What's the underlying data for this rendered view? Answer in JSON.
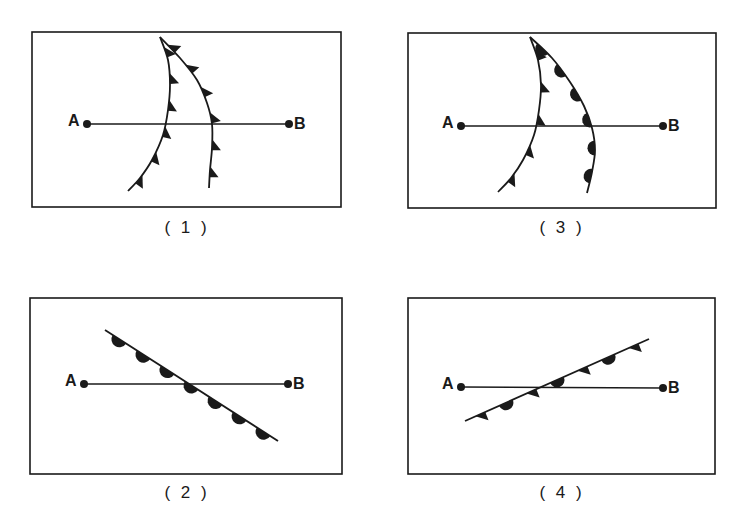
{
  "colors": {
    "ink": "#1a1a1a",
    "background": "#ffffff"
  },
  "panels": [
    {
      "id": "1",
      "caption": "( 1 )",
      "caption_pos": [
        187,
        229
      ],
      "box": [
        32,
        32,
        341,
        207
      ],
      "point_a": {
        "label": "A",
        "x": 87,
        "y": 124
      },
      "point_b": {
        "label": "B",
        "x": 289,
        "y": 124
      },
      "fronts": [
        {
          "type": "cold",
          "description": "Cold front (triangles) curving from top to lower-left",
          "path": [
            [
              160,
              37
            ],
            [
              168,
              60
            ],
            [
              170,
              85
            ],
            [
              168,
              110
            ],
            [
              163,
              135
            ],
            [
              152,
              160
            ],
            [
              140,
              178
            ],
            [
              128,
              191
            ]
          ],
          "symbol_count": 6,
          "side": "right"
        },
        {
          "type": "cold",
          "description": "Cold front (triangles) curving from top to bottom",
          "path": [
            [
              160,
              37
            ],
            [
              180,
              58
            ],
            [
              197,
              80
            ],
            [
              207,
              103
            ],
            [
              212,
              124
            ],
            [
              212,
              148
            ],
            [
              210,
              170
            ],
            [
              209,
              188
            ]
          ],
          "symbol_count": 6,
          "side": "right"
        }
      ]
    },
    {
      "id": "3",
      "caption": "( 3 )",
      "caption_pos": [
        562,
        229
      ],
      "box": [
        408,
        33,
        716,
        208
      ],
      "point_a": {
        "label": "A",
        "x": 461,
        "y": 126
      },
      "point_b": {
        "label": "B",
        "x": 663,
        "y": 126
      },
      "fronts": [
        {
          "type": "cold",
          "description": "Cold front (triangles) curving from top to lower-left",
          "path": [
            [
              530,
              37
            ],
            [
              538,
              60
            ],
            [
              541,
              85
            ],
            [
              539,
              110
            ],
            [
              534,
              135
            ],
            [
              523,
              160
            ],
            [
              511,
              178
            ],
            [
              498,
              192
            ]
          ],
          "symbol_count": 5,
          "side": "right"
        },
        {
          "type": "warm",
          "description": "Warm front (semicircles) curving from top to bottom",
          "path": [
            [
              530,
              37
            ],
            [
              552,
              58
            ],
            [
              570,
              82
            ],
            [
              584,
              106
            ],
            [
              592,
              128
            ],
            [
              595,
              150
            ],
            [
              592,
              172
            ],
            [
              587,
              193
            ]
          ],
          "symbol_count": 6,
          "side": "right"
        }
      ]
    },
    {
      "id": "2",
      "caption": "( 2 )",
      "caption_pos": [
        187,
        494
      ],
      "box": [
        30,
        298,
        342,
        474
      ],
      "point_a": {
        "label": "A",
        "x": 84,
        "y": 384
      },
      "point_b": {
        "label": "B",
        "x": 288,
        "y": 384
      },
      "fronts": [
        {
          "type": "warm",
          "description": "Warm front (semicircles) straight diagonal from upper-left to lower-right",
          "path": [
            [
              105,
              330
            ],
            [
              278,
              441
            ]
          ],
          "symbol_count": 7,
          "side": "left"
        }
      ]
    },
    {
      "id": "4",
      "caption": "( 4 )",
      "caption_pos": [
        562,
        494
      ],
      "box": [
        408,
        298,
        715,
        474
      ],
      "point_a": {
        "label": "A",
        "x": 461,
        "y": 387
      },
      "point_b": {
        "label": "B",
        "x": 663,
        "y": 388
      },
      "fronts": [
        {
          "type": "stationary",
          "description": "Stationary front: alternating triangles (below) and semicircles (above), diagonal lower-left to upper-right",
          "path": [
            [
              465,
              421
            ],
            [
              649,
              339
            ]
          ],
          "symbol_count": 7,
          "side": "alternating"
        }
      ]
    }
  ]
}
